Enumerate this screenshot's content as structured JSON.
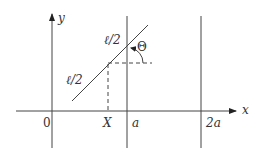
{
  "diagram": {
    "axes": {
      "x_label": "x",
      "y_label": "y"
    },
    "ticks": {
      "origin": "0",
      "X": "X",
      "a": "a",
      "two_a": "2a"
    },
    "segment_labels": {
      "upper_half": "ℓ/2",
      "lower_half": "ℓ/2"
    },
    "angle_label": "Θ",
    "colors": {
      "line": "#444444",
      "text": "#333333",
      "background": "#ffffff"
    }
  }
}
